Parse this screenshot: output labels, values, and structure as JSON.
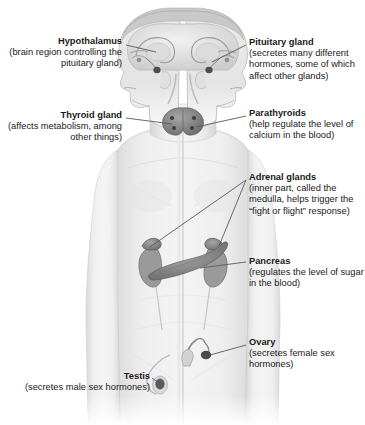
{
  "figure": {
    "background_color": "#ffffff",
    "text_color": "#1a1a1a",
    "line_color": "#4a4a4a",
    "gland_color": "#8d8d8d",
    "body_color": "#e9e9e9"
  },
  "labels": {
    "hypothalamus": {
      "title": "Hypothalamus",
      "description": "(brain region controlling the pituitary gland)",
      "align": "right"
    },
    "thyroid": {
      "title": "Thyroid gland",
      "description": "(affects metabolism, among other things)",
      "align": "right"
    },
    "testis": {
      "title": "Testis",
      "description": "(secretes male sex hormones)",
      "align": "right"
    },
    "pituitary": {
      "title": "Pituitary gland",
      "description": "(secretes many different hormones, some of which affect other glands)",
      "align": "left"
    },
    "parathyroids": {
      "title": "Parathyroids",
      "description": "(help regulate the level of calcium in the blood)",
      "align": "left"
    },
    "adrenal": {
      "title": "Adrenal glands",
      "description": "(inner part, called the medulla, helps trigger the “fight or flight” response)",
      "align": "left"
    },
    "pancreas": {
      "title": "Pancreas",
      "description": "(regulates the level of sugar in the blood)",
      "align": "left"
    },
    "ovary": {
      "title": "Ovary",
      "description": "(secretes female sex hormones)",
      "align": "left"
    }
  }
}
